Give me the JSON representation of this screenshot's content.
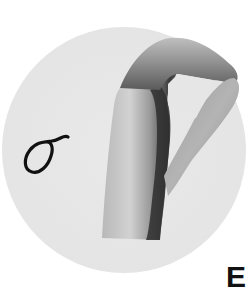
{
  "illustration": {
    "subject": "hand sign for Greek letter sigma",
    "letter": "σ",
    "letter_name": "sigma"
  },
  "cut_off_text": "E",
  "colors": {
    "background": "#ffffff",
    "circle": "#e6e6e6",
    "glyph_stroke": "#111111"
  }
}
